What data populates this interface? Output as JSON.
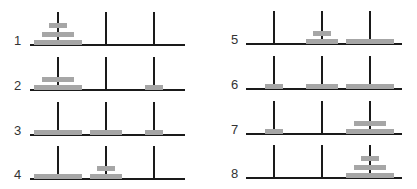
{
  "colors": {
    "peg": "#1a1a1a",
    "disk": "#a6a6a6",
    "label": "#333333",
    "background": "#ffffff"
  },
  "disk_widths": {
    "small": 18,
    "medium": 32,
    "large": 48
  },
  "frames": [
    {
      "step": "1",
      "pegs": [
        [
          "large",
          "medium",
          "small"
        ],
        [],
        []
      ]
    },
    {
      "step": "2",
      "pegs": [
        [
          "large",
          "medium"
        ],
        [],
        [
          "small"
        ]
      ]
    },
    {
      "step": "3",
      "pegs": [
        [
          "large"
        ],
        [
          "medium"
        ],
        [
          "small"
        ]
      ]
    },
    {
      "step": "4",
      "pegs": [
        [
          "large"
        ],
        [
          "medium",
          "small"
        ],
        []
      ]
    },
    {
      "step": "5",
      "pegs": [
        [],
        [
          "medium",
          "small"
        ],
        [
          "large"
        ]
      ]
    },
    {
      "step": "6",
      "pegs": [
        [
          "small"
        ],
        [
          "medium"
        ],
        [
          "large"
        ]
      ]
    },
    {
      "step": "7",
      "pegs": [
        [
          "small"
        ],
        [],
        [
          "large",
          "medium"
        ]
      ]
    },
    {
      "step": "8",
      "pegs": [
        [],
        [],
        [
          "large",
          "medium",
          "small"
        ]
      ]
    }
  ]
}
